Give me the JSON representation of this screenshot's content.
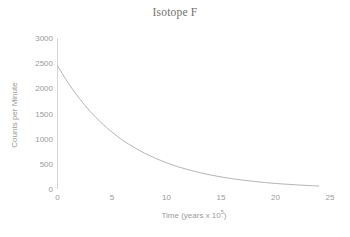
{
  "chart_data": {
    "type": "line",
    "title": "Isotope F",
    "xlabel": "Time (years x 10",
    "xlabel_exponent": "5",
    "xlabel_suffix": ")",
    "ylabel": "Counts per Minute",
    "xlim": [
      0,
      25
    ],
    "ylim": [
      0,
      3000
    ],
    "grid": false,
    "legend": "none",
    "line_color": "#b5b5b5",
    "axis_color": "#d4d4d4",
    "text_color": "#9a9a9a",
    "xticks": [
      0,
      5,
      10,
      15,
      20,
      25
    ],
    "xtick_labels": [
      "0",
      "5",
      "10",
      "15",
      "20",
      "25"
    ],
    "yticks": [
      0,
      500,
      1000,
      1500,
      2000,
      2500,
      3000
    ],
    "ytick_labels": [
      "0",
      "500",
      "1000",
      "1500",
      "2000",
      "2500",
      "3000"
    ],
    "series": [
      {
        "name": "Isotope F decay",
        "x": [
          0,
          1,
          2,
          3,
          4,
          5,
          6,
          7,
          8,
          9,
          10,
          11,
          12,
          13,
          14,
          15,
          16,
          17,
          18,
          19,
          20,
          21,
          22,
          23,
          24
        ],
        "y": [
          2450,
          2100,
          1800,
          1540,
          1320,
          1130,
          965,
          830,
          710,
          610,
          520,
          445,
          382,
          327,
          280,
          240,
          205,
          176,
          151,
          129,
          110,
          95,
          81,
          69,
          59
        ]
      }
    ]
  }
}
